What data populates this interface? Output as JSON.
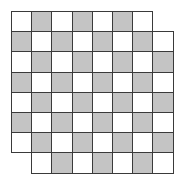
{
  "diagram": {
    "title": "",
    "rows": 8,
    "cols": 8,
    "removed_cells": [
      {
        "row": 0,
        "col": 7
      },
      {
        "row": 7,
        "col": 0
      }
    ],
    "colors": {
      "light": "#ffffff",
      "dark": "#c4c4c4",
      "grid_line": "#3a3a3a"
    },
    "cell_size_px": 20.2,
    "remaining_squares": 62,
    "light_squares": 32,
    "dark_squares": 30
  }
}
